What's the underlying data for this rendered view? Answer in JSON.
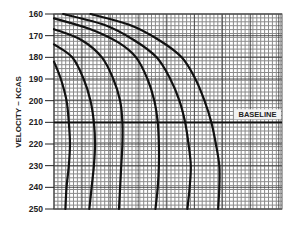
{
  "chart_data": {
    "type": "line",
    "title": "",
    "xlabel": "",
    "ylabel": "VELOCITY ~ KCAS",
    "y_ticks": [
      160,
      170,
      180,
      190,
      200,
      210,
      220,
      230,
      240,
      250
    ],
    "ylim": [
      160,
      250
    ],
    "y_inverted": true,
    "x_ticks": [],
    "xlim": [
      0,
      100
    ],
    "grid": true,
    "legend": "none",
    "baseline": {
      "label": "BASELINE",
      "value": 210
    },
    "series": [
      {
        "name": "curve-1",
        "points": [
          [
            0,
            182
          ],
          [
            3,
            190
          ],
          [
            5.5,
            200
          ],
          [
            6.5,
            210
          ],
          [
            7,
            220
          ],
          [
            6.5,
            230
          ],
          [
            5.5,
            240
          ],
          [
            5,
            250
          ]
        ]
      },
      {
        "name": "curve-2",
        "points": [
          [
            0,
            174
          ],
          [
            8,
            180
          ],
          [
            13,
            190
          ],
          [
            16,
            200
          ],
          [
            17.5,
            210
          ],
          [
            18,
            220
          ],
          [
            17.5,
            230
          ],
          [
            16.5,
            240
          ],
          [
            15.5,
            250
          ]
        ]
      },
      {
        "name": "curve-3",
        "points": [
          [
            0,
            167
          ],
          [
            12,
            172
          ],
          [
            21,
            180
          ],
          [
            26,
            190
          ],
          [
            29,
            200
          ],
          [
            30,
            210
          ],
          [
            30,
            220
          ],
          [
            29.5,
            230
          ],
          [
            29,
            240
          ],
          [
            28.5,
            250
          ]
        ]
      },
      {
        "name": "curve-4",
        "points": [
          [
            0,
            162
          ],
          [
            16,
            167
          ],
          [
            28,
            173
          ],
          [
            36,
            180
          ],
          [
            41,
            190
          ],
          [
            44,
            200
          ],
          [
            45.5,
            210
          ],
          [
            46,
            220
          ],
          [
            46,
            230
          ],
          [
            45.5,
            240
          ],
          [
            44.5,
            250
          ]
        ]
      },
      {
        "name": "curve-5",
        "points": [
          [
            4,
            160
          ],
          [
            22,
            165
          ],
          [
            35,
            172
          ],
          [
            45,
            180
          ],
          [
            51,
            190
          ],
          [
            55,
            200
          ],
          [
            57.5,
            210
          ],
          [
            59,
            220
          ],
          [
            60,
            230
          ],
          [
            59.5,
            240
          ],
          [
            58.5,
            250
          ]
        ]
      },
      {
        "name": "curve-6",
        "points": [
          [
            16,
            160
          ],
          [
            33,
            165
          ],
          [
            46,
            172
          ],
          [
            56,
            180
          ],
          [
            62,
            190
          ],
          [
            66,
            200
          ],
          [
            69,
            210
          ],
          [
            71,
            220
          ],
          [
            72.5,
            230
          ],
          [
            72.5,
            240
          ],
          [
            72,
            250
          ]
        ]
      }
    ]
  },
  "colors": {
    "grid_minor": "#8a8a8a",
    "grid_major": "#333333",
    "curve": "#111111",
    "background": "#ffffff"
  }
}
